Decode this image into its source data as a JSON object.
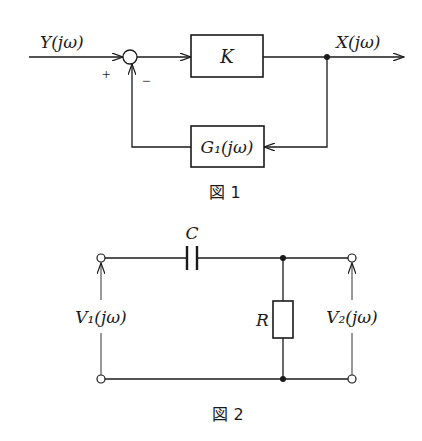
{
  "figure1": {
    "caption": "図 1",
    "input_label": "Y(jω)",
    "output_label": "X(jω)",
    "forward_block": "K",
    "feedback_block": "G₁(jω)",
    "plus_sign": "+",
    "minus_sign": "−"
  },
  "figure2": {
    "caption": "図 2",
    "capacitor_label": "C",
    "resistor_label": "R",
    "input_voltage_label": "V₁(jω)",
    "output_voltage_label": "V₂(jω)"
  }
}
